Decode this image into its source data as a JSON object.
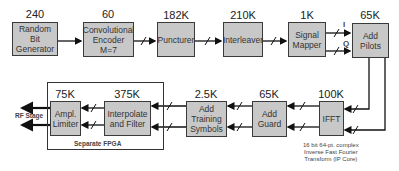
{
  "top_row": [
    {
      "id": "random-bit-generator",
      "label": "Random\nBit Generator",
      "value": "240"
    },
    {
      "id": "convolutional-encoder",
      "label": "Convolutional\nEncoder\nM=7",
      "value": "60"
    },
    {
      "id": "puncturer",
      "label": "Puncturer",
      "value": "182K"
    },
    {
      "id": "interleaver",
      "label": "Interleaver",
      "value": "210K"
    },
    {
      "id": "signal-mapper",
      "label": "Signal\nMapper",
      "value": "1K"
    },
    {
      "id": "add-pilots",
      "label": "Add Pilots",
      "value": "65K"
    }
  ],
  "bottom_row": [
    {
      "id": "ampl-limiter",
      "label": "Ampl.\nLimiter",
      "value": "75K"
    },
    {
      "id": "interpolate-filter",
      "label": "Interpolate\nand Filter",
      "value": "375K"
    },
    {
      "id": "add-training-symbols",
      "label": "Add\nTraining\nSymbols",
      "value": "2.5K"
    },
    {
      "id": "add-guard",
      "label": "Add\nGuard",
      "value": "65K"
    },
    {
      "id": "ifft",
      "label": "IFFT",
      "value": "100K"
    }
  ],
  "signals": {
    "i": "I",
    "q": "Q"
  },
  "rf_stage": "RF Stage",
  "fpga_label": "Separate FPGA",
  "ifft_note": "16 bit 64-pt. complex\nInverse Fast Fourier\nTransform (IP Core)"
}
